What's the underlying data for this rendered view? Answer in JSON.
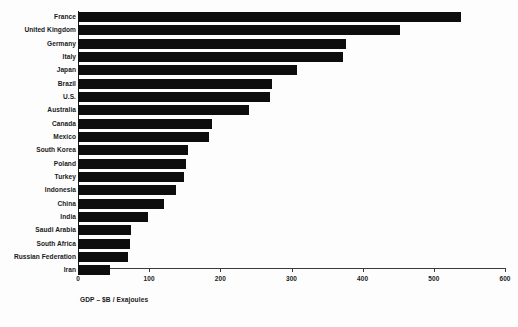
{
  "chart_data": {
    "type": "bar",
    "orientation": "horizontal",
    "title": "",
    "xlabel": "GDP – $B / Exajoules",
    "ylabel": "",
    "xlim": [
      0,
      600
    ],
    "xticks": [
      0,
      100,
      200,
      300,
      400,
      500,
      600
    ],
    "xtick_labels": [
      "0",
      "100",
      "200",
      "300",
      "400",
      "500",
      "600"
    ],
    "grid": false,
    "legend": null,
    "bar_color": "#0d0d0d",
    "background_color": "#fdfdfd",
    "categories": [
      "France",
      "United Kingdom",
      "Germany",
      "Italy",
      "Japan",
      "Brazil",
      "U.S.",
      "Australia",
      "Canada",
      "Mexico",
      "South Korea",
      "Poland",
      "Turkey",
      "Indonesia",
      "China",
      "India",
      "Saudi Arabia",
      "South Africa",
      "Russian Federation",
      "Iran"
    ],
    "values": [
      538,
      452,
      377,
      372,
      308,
      273,
      270,
      240,
      188,
      184,
      155,
      152,
      149,
      138,
      121,
      98,
      75,
      73,
      70,
      45
    ]
  }
}
